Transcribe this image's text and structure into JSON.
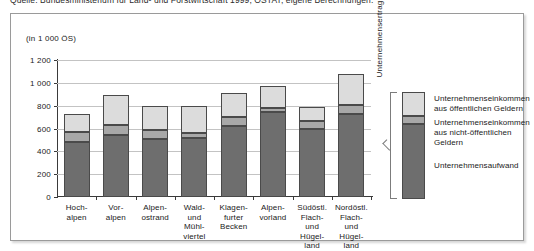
{
  "source_caption": "Quelle: Bundesministerium für Land- und Forstwirtschaft 1999; ÖSTAT; eigene Berechnungen.",
  "units_label": "(in 1 000 ÖS)",
  "ertrag_label": "Unternehmensertrag",
  "legend": {
    "entries": [
      {
        "key": "public",
        "label": "Unternehmenseinkommen\naus öffentlichen Geldern",
        "color": "#dcdcdc"
      },
      {
        "key": "nonpublic",
        "label": "Unternehmenseinkommen\naus nicht-öffentlichen Geldern",
        "color": "#a8a8a8"
      },
      {
        "key": "aufwand",
        "label": "Unternehmensaufwand",
        "color": "#6e6e6e"
      }
    ]
  },
  "chart_data": {
    "type": "bar",
    "stacked": true,
    "title": "",
    "xlabel": "",
    "ylabel": "(in 1 000 ÖS)",
    "ylim": [
      0,
      1200
    ],
    "yticks": [
      0,
      200,
      400,
      600,
      800,
      1000,
      1200
    ],
    "ytick_labels": [
      "0",
      "200",
      "400",
      "600",
      "800",
      "1 000",
      "1 200"
    ],
    "grid": true,
    "legend_position": "right",
    "categories": [
      "Hoch-\nalpen",
      "Vor-\nalpen",
      "Alpen-\nostrand",
      "Wald-\nund\nMühl-\nviertel",
      "Klagen-\nfurter\nBecken",
      "Alpen-\nvorland",
      "Südöstl.\nFlach-\nund\nHügel-\nland",
      "Nordöstl.\nFlach-\nund\nHügel-\nland"
    ],
    "series": [
      {
        "name": "Unternehmensaufwand",
        "color": "#6e6e6e",
        "values": [
          480,
          545,
          505,
          520,
          625,
          745,
          600,
          730
        ]
      },
      {
        "name": "Unternehmenseinkommen aus nicht-öffentlichen Geldern",
        "color": "#a8a8a8",
        "values": [
          90,
          85,
          80,
          45,
          75,
          35,
          70,
          75
        ]
      },
      {
        "name": "Unternehmenseinkommen aus öffentlichen Geldern",
        "color": "#dcdcdc",
        "values": [
          160,
          265,
          215,
          230,
          210,
          190,
          115,
          270
        ]
      }
    ],
    "totals": [
      730,
      895,
      800,
      795,
      910,
      970,
      785,
      1075
    ]
  }
}
